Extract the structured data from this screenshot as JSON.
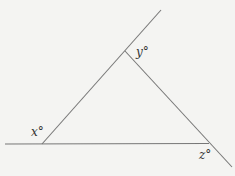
{
  "diagram": {
    "type": "triangle-exterior-angles",
    "labels": {
      "x": "x°",
      "y": "y°",
      "z": "z°"
    },
    "colors": {
      "background": "#f4f4f2",
      "line": "#777777",
      "text": "#333333"
    }
  }
}
